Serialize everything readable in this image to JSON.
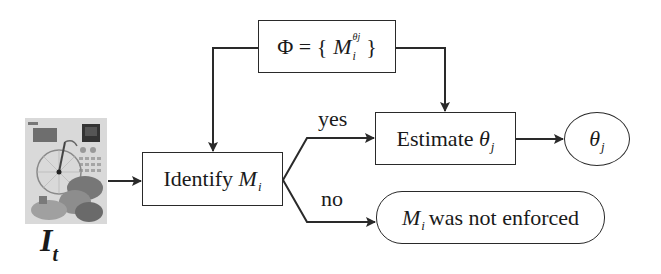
{
  "diagram": {
    "input": {
      "image_desc": "input image thumbnail (collage with penny-farthing bicycle)",
      "label_main": "I",
      "label_sub": "t"
    },
    "phi_box": {
      "prefix": "Φ = {",
      "symbol": "M",
      "sup": "θj",
      "sub": "i",
      "suffix": "}"
    },
    "identify_box": {
      "text": "Identify",
      "symbol": "M",
      "sub": "i"
    },
    "estimate_box": {
      "text": "Estimate",
      "symbol": "θ",
      "sub": "j"
    },
    "output_theta": {
      "symbol": "θ",
      "sub": "j"
    },
    "not_enforced": {
      "symbol": "M",
      "sub": "i",
      "text": "was not enforced"
    },
    "edges": {
      "yes_label": "yes",
      "no_label": "no"
    },
    "colors": {
      "stroke": "#2a2a2a",
      "background": "#ffffff"
    }
  }
}
